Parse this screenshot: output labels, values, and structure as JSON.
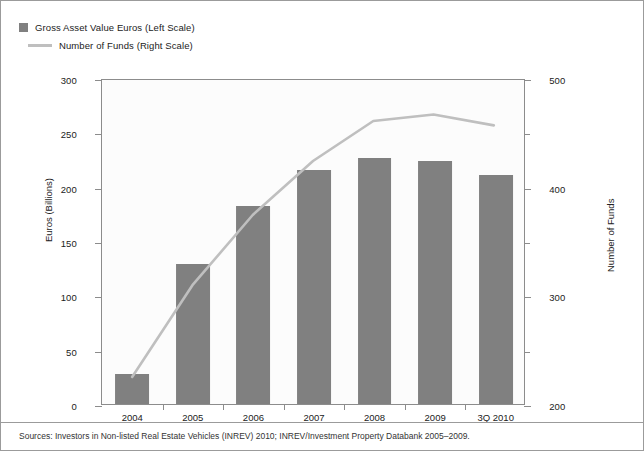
{
  "legend": {
    "items": [
      {
        "label": "Gross Asset Value Euros (Left Scale)",
        "marker": "bar-swatch",
        "color": "#808080"
      },
      {
        "label": "Number of Funds (Right Scale)",
        "marker": "line-swatch",
        "color": "#bfbfbf"
      }
    ]
  },
  "source": {
    "text": "Sources: Investors in Non-listed Real Estate Vehicles (INREV) 2010; INREV/Investment Property Databank 2005–2009."
  },
  "chart_data": {
    "type": "bar",
    "title": "",
    "categories": [
      "2004",
      "2005",
      "2006",
      "2007",
      "2008",
      "2009",
      "3Q 2010"
    ],
    "series": [
      {
        "name": "Gross Asset Value Euros (Left Scale)",
        "type": "bar",
        "axis": "left",
        "color": "#808080",
        "values": [
          28,
          129,
          182,
          215,
          226,
          224,
          211
        ]
      },
      {
        "name": "Number of Funds (Right Scale)",
        "type": "line",
        "axis": "right",
        "color": "#bfbfbf",
        "values": [
          225,
          310,
          375,
          425,
          462,
          468,
          458
        ]
      }
    ],
    "xlabel": "",
    "ylabel": "Euros (Billions)",
    "y2label": "Number of Funds",
    "ylim": [
      0,
      300
    ],
    "y2lim": [
      200,
      500
    ],
    "yticks": [
      0,
      50,
      100,
      150,
      200,
      250,
      300
    ],
    "y2ticks": [
      200,
      250,
      300,
      350,
      400,
      450,
      500
    ],
    "y2ticklabels": [
      "200",
      "",
      "300",
      "",
      "400",
      "",
      "500"
    ],
    "grid": false,
    "legend_position": "top-left"
  }
}
